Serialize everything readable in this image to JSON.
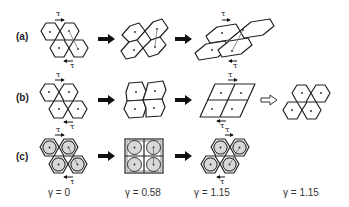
{
  "figure": {
    "rows": [
      {
        "label": "(a)",
        "description": "hexagonal cells sheared progressively with cell walls stretching"
      },
      {
        "label": "(b)",
        "description": "hexagonal cells sheared into rhombic lattice, then recovering to hexagonal"
      },
      {
        "label": "(c)",
        "description": "hexagonal cells with inscribed circular disks sheared"
      }
    ],
    "stress_symbol": "τ",
    "strain_labels": [
      "γ = 0",
      "γ = 0.58",
      "γ = 1.15",
      "γ = 1.15"
    ],
    "colors": {
      "line": "#222222",
      "disk_fill": "#d8d8d8",
      "background": "#ffffff"
    }
  }
}
